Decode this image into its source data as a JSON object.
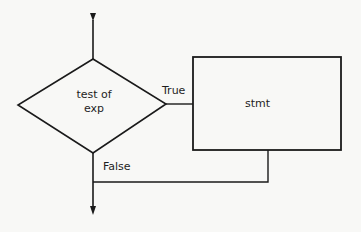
{
  "diagram": {
    "type": "flowchart",
    "decision": {
      "line1": "test of",
      "line2": "exp"
    },
    "process": {
      "label": "stmt"
    },
    "edges": {
      "true_label": "True",
      "false_label": "False"
    },
    "colors": {
      "stroke": "#1a1a1a",
      "background": "#f8f8f6",
      "text": "#1e1e1e"
    }
  }
}
